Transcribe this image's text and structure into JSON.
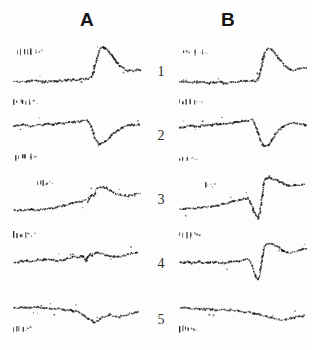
{
  "figure": {
    "title": "",
    "background_color": "#fdfdfd",
    "ink_color": "#161616",
    "width": 312,
    "height": 350,
    "column_headers": [
      {
        "label": "A",
        "x": 80,
        "y": 9
      },
      {
        "label": "B",
        "x": 221,
        "y": 9
      }
    ],
    "row_labels": [
      {
        "label": "1",
        "x": 152,
        "y": 64
      },
      {
        "label": "2",
        "x": 152,
        "y": 128
      },
      {
        "label": "3",
        "x": 152,
        "y": 192
      },
      {
        "label": "4",
        "x": 152,
        "y": 256
      },
      {
        "label": "5",
        "x": 152,
        "y": 312
      }
    ]
  },
  "chart_data": {
    "type": "scatter",
    "title": "",
    "xlabel": "",
    "ylabel": "",
    "grid": false,
    "legend": "none",
    "marker": "dot",
    "panel_geometry": {
      "column_a_x": 12,
      "column_b_x": 178,
      "panel_width": 128,
      "panel_height": 54,
      "row_tops": [
        40,
        104,
        168,
        232,
        288
      ],
      "xlim": [
        0,
        128
      ],
      "ylim": [
        0,
        54
      ]
    },
    "series": [
      {
        "name": "A1",
        "column": "A",
        "row": 1,
        "x": [
          2,
          6,
          10,
          14,
          18,
          22,
          26,
          30,
          34,
          38,
          42,
          46,
          50,
          54,
          58,
          62,
          66,
          70,
          74,
          78,
          80,
          82,
          84,
          86,
          88,
          90,
          93,
          96,
          99,
          102,
          105,
          108,
          111,
          114,
          117,
          120,
          124,
          128
        ],
        "y": [
          42,
          42,
          42,
          42,
          41,
          41,
          41,
          42,
          42,
          41,
          41,
          41,
          41,
          40,
          40,
          40,
          40,
          39,
          39,
          38,
          36,
          30,
          22,
          14,
          9,
          7,
          8,
          11,
          15,
          19,
          23,
          26,
          28,
          30,
          31,
          31,
          30,
          30
        ]
      },
      {
        "name": "B1",
        "column": "B",
        "row": 1,
        "x": [
          2,
          6,
          10,
          14,
          18,
          22,
          26,
          30,
          34,
          38,
          42,
          46,
          50,
          54,
          58,
          62,
          66,
          70,
          74,
          78,
          80,
          82,
          84,
          86,
          88,
          90,
          93,
          96,
          99,
          102,
          105,
          108,
          111,
          114,
          117,
          120,
          124,
          128
        ],
        "y": [
          42,
          42,
          42,
          43,
          42,
          42,
          42,
          43,
          43,
          43,
          42,
          43,
          43,
          42,
          42,
          41,
          41,
          41,
          41,
          41,
          40,
          34,
          24,
          15,
          10,
          8,
          9,
          12,
          16,
          20,
          24,
          27,
          29,
          30,
          30,
          29,
          28,
          28
        ]
      },
      {
        "name": "A2",
        "column": "A",
        "row": 2,
        "x": [
          2,
          6,
          10,
          14,
          18,
          22,
          26,
          30,
          34,
          38,
          42,
          46,
          50,
          54,
          58,
          62,
          66,
          70,
          74,
          76,
          78,
          80,
          82,
          84,
          86,
          88,
          91,
          94,
          97,
          100,
          104,
          108,
          112,
          116,
          120,
          124,
          128
        ],
        "y": [
          22,
          22,
          21,
          21,
          22,
          22,
          21,
          21,
          20,
          20,
          20,
          20,
          19,
          19,
          18,
          18,
          18,
          17,
          16,
          17,
          20,
          25,
          31,
          36,
          39,
          40,
          39,
          37,
          34,
          31,
          28,
          25,
          23,
          22,
          21,
          21,
          21
        ]
      },
      {
        "name": "B2",
        "column": "B",
        "row": 2,
        "x": [
          2,
          6,
          10,
          14,
          18,
          22,
          26,
          30,
          34,
          38,
          42,
          46,
          50,
          54,
          58,
          62,
          66,
          70,
          74,
          76,
          78,
          80,
          82,
          84,
          86,
          88,
          91,
          94,
          97,
          100,
          104,
          108,
          112,
          116,
          120,
          124,
          128
        ],
        "y": [
          23,
          23,
          22,
          22,
          22,
          22,
          21,
          21,
          21,
          20,
          20,
          20,
          19,
          19,
          18,
          18,
          17,
          17,
          16,
          18,
          22,
          28,
          34,
          39,
          42,
          42,
          40,
          36,
          31,
          27,
          23,
          21,
          19,
          19,
          19,
          20,
          21
        ]
      },
      {
        "name": "A3",
        "column": "A",
        "row": 3,
        "x": [
          2,
          6,
          10,
          14,
          18,
          22,
          26,
          30,
          34,
          38,
          42,
          46,
          50,
          54,
          58,
          62,
          66,
          70,
          74,
          76,
          78,
          80,
          82,
          84,
          86,
          88,
          91,
          94,
          97,
          100,
          104,
          108,
          112,
          116,
          120,
          124,
          128
        ],
        "y": [
          42,
          42,
          42,
          42,
          41,
          42,
          42,
          41,
          41,
          40,
          40,
          39,
          38,
          37,
          36,
          35,
          34,
          33,
          32,
          34,
          30,
          26,
          28,
          22,
          20,
          19,
          19,
          20,
          22,
          24,
          26,
          27,
          28,
          28,
          27,
          26,
          26
        ]
      },
      {
        "name": "B3",
        "column": "B",
        "row": 3,
        "x": [
          2,
          6,
          10,
          14,
          18,
          22,
          26,
          30,
          34,
          38,
          42,
          46,
          50,
          54,
          58,
          62,
          66,
          70,
          72,
          74,
          76,
          78,
          80,
          82,
          84,
          86,
          88,
          91,
          94,
          98,
          102,
          106,
          110,
          114,
          118,
          122,
          126
        ],
        "y": [
          41,
          41,
          40,
          41,
          40,
          40,
          39,
          39,
          38,
          38,
          37,
          36,
          35,
          34,
          33,
          32,
          31,
          30,
          33,
          38,
          44,
          48,
          50,
          44,
          30,
          14,
          10,
          10,
          11,
          12,
          14,
          16,
          18,
          18,
          17,
          17,
          16
        ]
      },
      {
        "name": "A4",
        "column": "A",
        "row": 4,
        "x": [
          2,
          6,
          10,
          14,
          18,
          22,
          26,
          30,
          34,
          38,
          42,
          46,
          50,
          54,
          58,
          62,
          66,
          70,
          72,
          74,
          76,
          78,
          80,
          82,
          84,
          86,
          90,
          94,
          98,
          102,
          106,
          110,
          114,
          118,
          122,
          126
        ],
        "y": [
          30,
          30,
          29,
          29,
          29,
          29,
          28,
          28,
          27,
          27,
          28,
          29,
          28,
          27,
          26,
          25,
          25,
          24,
          26,
          29,
          25,
          22,
          24,
          22,
          20,
          21,
          22,
          23,
          24,
          25,
          25,
          24,
          23,
          22,
          21,
          20
        ]
      },
      {
        "name": "B4",
        "column": "B",
        "row": 4,
        "x": [
          2,
          6,
          10,
          14,
          18,
          22,
          26,
          30,
          34,
          38,
          42,
          46,
          50,
          54,
          58,
          62,
          66,
          70,
          72,
          74,
          76,
          78,
          80,
          82,
          84,
          86,
          88,
          92,
          96,
          100,
          104,
          108,
          112,
          116,
          120,
          124,
          128
        ],
        "y": [
          31,
          31,
          30,
          31,
          30,
          30,
          31,
          31,
          30,
          30,
          31,
          31,
          30,
          30,
          29,
          29,
          28,
          27,
          29,
          34,
          40,
          45,
          48,
          42,
          28,
          16,
          12,
          12,
          13,
          15,
          18,
          20,
          21,
          20,
          19,
          18,
          17
        ]
      },
      {
        "name": "A5",
        "column": "A",
        "row": 5,
        "x": [
          2,
          6,
          10,
          14,
          18,
          22,
          26,
          30,
          34,
          38,
          42,
          46,
          50,
          54,
          58,
          62,
          66,
          70,
          74,
          78,
          82,
          86,
          90,
          94,
          98,
          102,
          106,
          110,
          114,
          118,
          122,
          126
        ],
        "y": [
          20,
          20,
          19,
          20,
          20,
          19,
          19,
          20,
          20,
          21,
          21,
          21,
          21,
          22,
          22,
          23,
          24,
          26,
          29,
          32,
          34,
          33,
          30,
          28,
          27,
          28,
          29,
          28,
          27,
          26,
          25,
          24
        ]
      },
      {
        "name": "B5",
        "column": "B",
        "row": 5,
        "x": [
          2,
          6,
          10,
          14,
          18,
          22,
          26,
          30,
          34,
          38,
          42,
          46,
          50,
          54,
          58,
          62,
          66,
          70,
          74,
          78,
          82,
          86,
          90,
          94,
          98,
          102,
          106,
          110,
          114,
          118,
          122,
          126
        ],
        "y": [
          20,
          20,
          20,
          21,
          21,
          21,
          21,
          21,
          21,
          22,
          22,
          22,
          22,
          22,
          23,
          23,
          24,
          24,
          25,
          26,
          27,
          28,
          29,
          30,
          31,
          32,
          32,
          31,
          30,
          29,
          28,
          28
        ]
      }
    ],
    "artifact_marks": [
      {
        "name": "A1-upper",
        "x": 16,
        "y": 45,
        "count": 6
      },
      {
        "name": "A1-lower",
        "x": 12,
        "y": 95,
        "count": 6
      },
      {
        "name": "B1-upper",
        "x": 182,
        "y": 45,
        "count": 6
      },
      {
        "name": "B1-lower",
        "x": 178,
        "y": 95,
        "count": 6
      },
      {
        "name": "A2-lower",
        "x": 14,
        "y": 150,
        "count": 5
      },
      {
        "name": "B2-lower",
        "x": 178,
        "y": 152,
        "count": 4
      },
      {
        "name": "A3-spikes",
        "x": 36,
        "y": 176,
        "count": 3
      },
      {
        "name": "B3-spike",
        "x": 204,
        "y": 178,
        "count": 1
      },
      {
        "name": "A4-upper",
        "x": 12,
        "y": 228,
        "count": 5
      },
      {
        "name": "B4-upper",
        "x": 178,
        "y": 228,
        "count": 5
      },
      {
        "name": "A5-lower",
        "x": 12,
        "y": 322,
        "count": 4
      },
      {
        "name": "B5-lower",
        "x": 178,
        "y": 322,
        "count": 4
      }
    ]
  }
}
